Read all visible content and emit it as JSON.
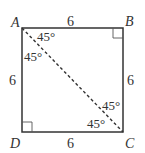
{
  "figure": {
    "shape": "square",
    "stroke_color": "#333333",
    "vertices": [
      {
        "id": "A",
        "label": "A"
      },
      {
        "id": "B",
        "label": "B"
      },
      {
        "id": "C",
        "label": "C"
      },
      {
        "id": "D",
        "label": "D"
      }
    ],
    "sides": [
      {
        "id": "AB",
        "label": "6"
      },
      {
        "id": "BC",
        "label": "6"
      },
      {
        "id": "CD",
        "label": "6"
      },
      {
        "id": "DA",
        "label": "6"
      }
    ],
    "diagonal": {
      "from": "A",
      "to": "C",
      "style": "dashed"
    },
    "angles": [
      {
        "at": "A",
        "side": "AB",
        "label": "45°"
      },
      {
        "at": "A",
        "side": "AD",
        "label": "45°"
      },
      {
        "at": "C",
        "side": "CB",
        "label": "45°"
      },
      {
        "at": "C",
        "side": "CD",
        "label": "45°"
      }
    ],
    "right_angles": [
      "B",
      "D"
    ]
  }
}
